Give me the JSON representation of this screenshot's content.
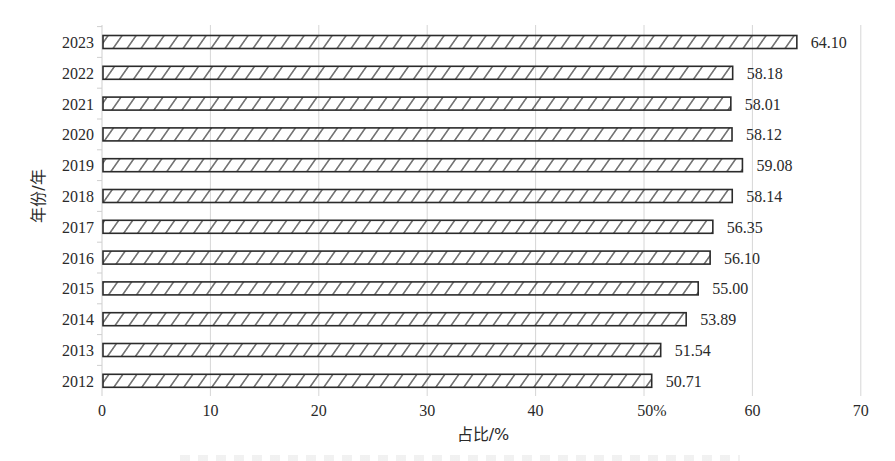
{
  "chart_data": {
    "type": "bar",
    "orientation": "horizontal",
    "title": "",
    "xlabel": "占比/%",
    "ylabel": "年份/年",
    "categories": [
      "2023",
      "2022",
      "2021",
      "2020",
      "2019",
      "2018",
      "2017",
      "2016",
      "2015",
      "2014",
      "2013",
      "2012"
    ],
    "values": [
      64.1,
      58.18,
      58.01,
      58.12,
      59.08,
      58.14,
      56.35,
      56.1,
      55.0,
      53.89,
      51.54,
      50.71
    ],
    "value_labels": [
      "64.10",
      "58.18",
      "58.01",
      "58.12",
      "59.08",
      "58.14",
      "56.35",
      "56.10",
      "55.00",
      "53.89",
      "51.54",
      "50.71"
    ],
    "xlim": [
      0,
      70
    ],
    "xticks": [
      0,
      10,
      20,
      30,
      40,
      50,
      60,
      70
    ],
    "xtick_labels": [
      "0",
      "10",
      "20",
      "30",
      "40",
      "50%",
      "60",
      "70"
    ],
    "grid": "vertical",
    "legend": null,
    "bar_style": "diagonal-hatch, dark outline, white fill"
  },
  "colors": {
    "bar_outline": "#2b2b2b",
    "hatch": "#2b2b2b",
    "grid": "#d6d6d6",
    "text": "#2a2a2a",
    "background": "#ffffff"
  }
}
